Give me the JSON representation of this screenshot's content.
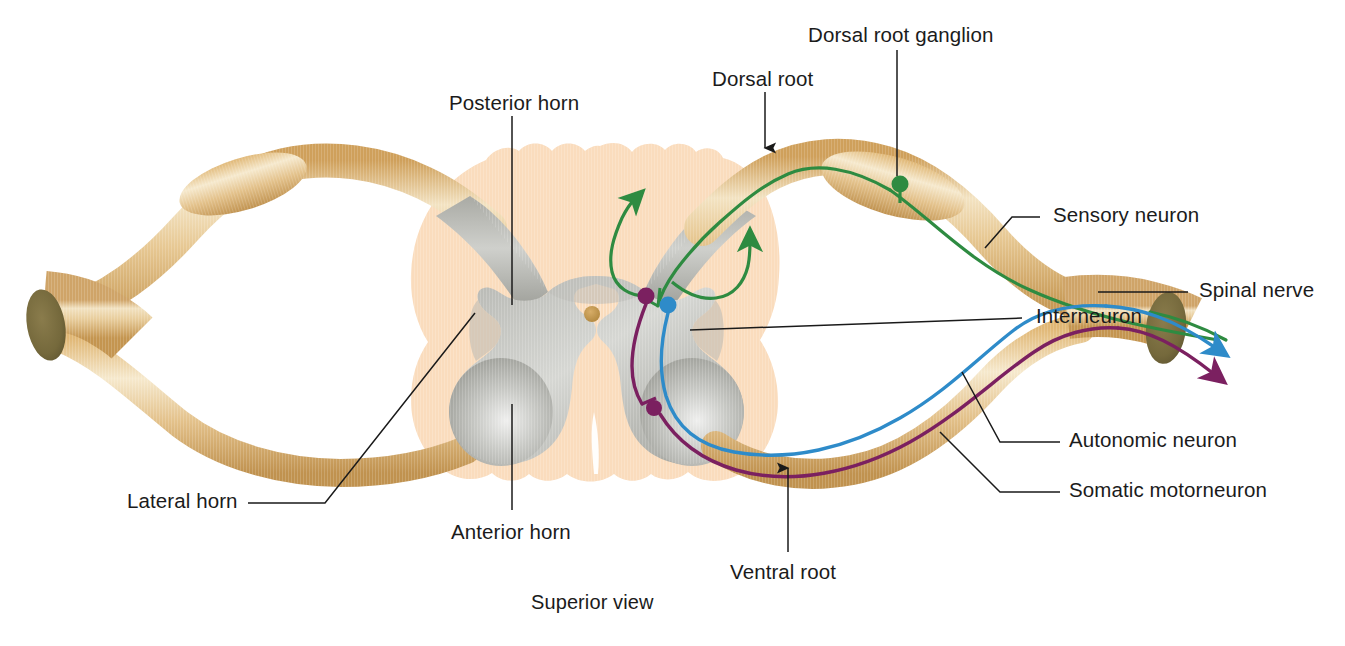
{
  "figure": {
    "caption": "Superior view",
    "view_label": "Superior view"
  },
  "labels": {
    "dorsal_root_ganglion": "Dorsal root ganglion",
    "dorsal_root": "Dorsal root",
    "posterior_horn": "Posterior horn",
    "sensory_neuron": "Sensory neuron",
    "spinal_nerve": "Spinal nerve",
    "interneuron": "Interneuron",
    "autonomic_neuron": "Autonomic neuron",
    "somatic_motorneuron": "Somatic motorneuron",
    "ventral_root": "Ventral root",
    "anterior_horn": "Anterior horn",
    "lateral_horn": "Lateral horn",
    "superior_view": "Superior view"
  },
  "colors": {
    "background": "#ffffff",
    "white_matter": "#fadcbd",
    "white_matter_edge": "#f6cfa8",
    "gray_matter": "#a8a9a3",
    "gray_matter_light": "#e3e4e0",
    "nerve_tan": "#d8ab63",
    "nerve_tan_light": "#f0dbb0",
    "nerve_cut_face": "#7d7243",
    "sensory_green": "#2e8b41",
    "autonomic_blue": "#2e8bc9",
    "motor_purple": "#7b2060",
    "central_canal": "#c69a52",
    "leader_line": "#1a1a1a",
    "text": "#1b1b1b"
  },
  "structures": [
    {
      "name": "posterior-horn",
      "type": "gray-matter-horn",
      "side": "both",
      "orientation": "upper"
    },
    {
      "name": "anterior-horn",
      "type": "gray-matter-horn",
      "side": "both",
      "orientation": "lower"
    },
    {
      "name": "lateral-horn",
      "type": "gray-matter-horn",
      "side": "both",
      "orientation": "lateral"
    },
    {
      "name": "central-canal",
      "type": "canal",
      "side": "center"
    },
    {
      "name": "white-matter",
      "type": "cord-outline",
      "side": "both"
    },
    {
      "name": "dorsal-root",
      "type": "nerve-root",
      "side": "both",
      "orientation": "posterior"
    },
    {
      "name": "ventral-root",
      "type": "nerve-root",
      "side": "both",
      "orientation": "anterior"
    },
    {
      "name": "dorsal-root-ganglion",
      "type": "ganglion",
      "side": "both"
    },
    {
      "name": "spinal-nerve",
      "type": "nerve-trunk",
      "side": "both"
    }
  ],
  "neurons": [
    {
      "name": "sensory-neuron",
      "color": "#2e8b41",
      "pathway": "dorsal root ganglion to posterior horn, ascending branches",
      "cell_body": "dorsal root ganglion",
      "arrows": 2,
      "direction": "afferent"
    },
    {
      "name": "interneuron",
      "color": "#2e8bc9",
      "pathway": "posterior horn to ventral root",
      "cell_body": "gray matter",
      "arrows": 1,
      "direction": "efferent"
    },
    {
      "name": "autonomic-neuron",
      "color": "#2e8bc9",
      "pathway": "lateral horn through ventral root to spinal nerve",
      "arrows": 1,
      "direction": "efferent"
    },
    {
      "name": "somatic-motorneuron",
      "color": "#7b2060",
      "pathway": "anterior horn through ventral root to spinal nerve",
      "arrows": 1,
      "direction": "efferent"
    }
  ]
}
